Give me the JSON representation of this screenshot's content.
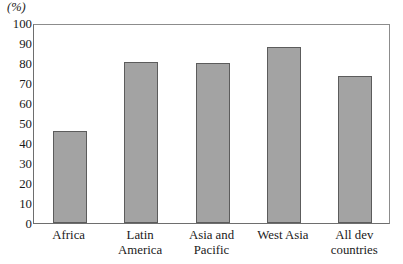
{
  "chart_data": {
    "type": "bar",
    "title": "",
    "subtitle": "",
    "xlabel": "",
    "ylabel": "(%)",
    "unit_label": "(%)",
    "categories": [
      "Africa",
      "Latin America",
      "Asia and Pacific",
      "West Asia",
      "All dev countries"
    ],
    "values": [
      46,
      80.5,
      80,
      88,
      73.5
    ],
    "ylim": [
      0,
      100
    ],
    "ytick_labels": [
      "100",
      "90",
      "80",
      "70",
      "60",
      "50",
      "40",
      "30",
      "20",
      "10",
      "0"
    ],
    "ytick_values": [
      100,
      90,
      80,
      70,
      60,
      50,
      40,
      30,
      20,
      10,
      0
    ],
    "grid": false,
    "legend": false,
    "legend_position": "none",
    "bar_color": "#a3a3a3",
    "bar_border_color": "#5c5c5c",
    "axis_color": "#6e6e6e",
    "bars": [
      {
        "label": "Africa",
        "label_lines": "Africa",
        "value": 46
      },
      {
        "label": "Latin America",
        "label_lines": "Latin\nAmerica",
        "value": 80.5
      },
      {
        "label": "Asia and Pacific",
        "label_lines": "Asia and\nPacific",
        "value": 80
      },
      {
        "label": "West Asia",
        "label_lines": "West Asia",
        "value": 88
      },
      {
        "label": "All dev countries",
        "label_lines": "All dev\ncountries",
        "value": 73.5
      }
    ]
  }
}
